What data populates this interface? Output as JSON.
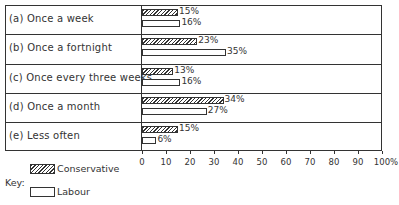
{
  "chart_data": {
    "type": "bar",
    "orientation": "horizontal",
    "categories": [
      "(a) Once a week",
      "(b) Once a fortnight",
      "(c) Once every three weeks",
      "(d) Once a month",
      "(e) Less often"
    ],
    "series": [
      {
        "name": "Conservative",
        "values": [
          15,
          23,
          13,
          34,
          15
        ],
        "pattern": "hatched"
      },
      {
        "name": "Labour",
        "values": [
          16,
          35,
          16,
          27,
          6
        ],
        "pattern": "open"
      }
    ],
    "value_labels": {
      "Conservative": [
        "15%",
        "23%",
        "13%",
        "34%",
        "15%"
      ],
      "Labour": [
        "16%",
        "35%",
        "16%",
        "27%",
        "6%"
      ]
    },
    "xaxis": {
      "ticks": [
        "0",
        "10",
        "20",
        "30",
        "40",
        "50",
        "60",
        "70",
        "80",
        "90",
        "100%"
      ],
      "range": [
        0,
        100
      ]
    },
    "legend": {
      "title": "Key:",
      "entries": [
        "Conservative",
        "Labour"
      ],
      "position": "bottom-left"
    },
    "grid": false
  },
  "key": {
    "title": "Key:",
    "conservative": "Conservative",
    "labour": "Labour"
  }
}
